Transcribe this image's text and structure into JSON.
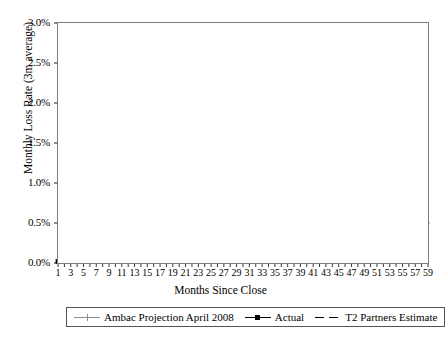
{
  "chart_data": {
    "type": "line",
    "title": "",
    "xlabel": "Months Since Close",
    "ylabel": "Monthly Loss Rate (3m average)",
    "xlim": [
      1,
      59
    ],
    "ylim": [
      0,
      3.0
    ],
    "y_tick_labels": [
      "0.0%",
      "0.5%",
      "1.0%",
      "1.5%",
      "2.0%",
      "2.5%",
      "3.0%"
    ],
    "y_tick_values": [
      0,
      0.5,
      1.0,
      1.5,
      2.0,
      2.5,
      3.0
    ],
    "x_tick_labels": [
      "1",
      "3",
      "5",
      "7",
      "9",
      "11",
      "13",
      "15",
      "17",
      "19",
      "21",
      "23",
      "25",
      "27",
      "29",
      "31",
      "33",
      "35",
      "37",
      "39",
      "41",
      "43",
      "45",
      "47",
      "49",
      "51",
      "53",
      "55",
      "57",
      "59"
    ],
    "x_tick_values": [
      1,
      3,
      5,
      7,
      9,
      11,
      13,
      15,
      17,
      19,
      21,
      23,
      25,
      27,
      29,
      31,
      33,
      35,
      37,
      39,
      41,
      43,
      45,
      47,
      49,
      51,
      53,
      55,
      57,
      59
    ],
    "x_minor_interval": 1,
    "grid": "horizontal-dotted",
    "legend_position": "bottom",
    "series": [
      {
        "name": "Ambac Projection April 2008",
        "color": "#8a8a8a",
        "style": "solid",
        "marker": "cross",
        "x": [
          1,
          2,
          3,
          4,
          5,
          6,
          7,
          8,
          9,
          10,
          11,
          12,
          13,
          14,
          15,
          16,
          17,
          18,
          19,
          20,
          21,
          22,
          23,
          24,
          25,
          26,
          27,
          28,
          29,
          30,
          31,
          32,
          33,
          34,
          35,
          36,
          37,
          38,
          39,
          40,
          41,
          42,
          43,
          44,
          45,
          46,
          47,
          48,
          49,
          50,
          51,
          52,
          53,
          54,
          55,
          56,
          57,
          58,
          59
        ],
        "y": [
          0.02,
          0.03,
          0.04,
          0.05,
          0.07,
          0.22,
          0.52,
          0.95,
          1.45,
          1.93,
          2.3,
          2.48,
          2.6,
          2.52,
          2.35,
          2.22,
          2.1,
          2.0,
          1.91,
          1.83,
          1.75,
          1.68,
          1.61,
          1.55,
          1.49,
          1.44,
          1.39,
          1.34,
          1.29,
          1.25,
          1.21,
          1.18,
          1.15,
          1.13,
          1.11,
          1.08,
          1.02,
          0.93,
          0.84,
          0.78,
          0.74,
          0.72,
          0.7,
          0.69,
          0.67,
          0.66,
          0.64,
          0.63,
          0.62,
          0.6,
          0.59,
          0.58,
          0.56,
          0.55,
          0.54,
          0.53,
          0.52,
          0.51,
          0.5
        ]
      },
      {
        "name": "Actual",
        "color": "#000000",
        "style": "solid",
        "marker": "square",
        "x": [
          1,
          2,
          3,
          4,
          5,
          6,
          7,
          8,
          9,
          10,
          11,
          12,
          13,
          14,
          15,
          16,
          17,
          18,
          19,
          20,
          21
        ],
        "y": [
          0.02,
          0.03,
          0.04,
          0.05,
          0.07,
          0.22,
          0.52,
          0.95,
          1.45,
          1.93,
          2.3,
          2.37,
          2.35,
          2.4,
          2.43,
          2.56,
          2.51,
          2.5,
          2.47,
          2.52,
          2.58
        ]
      },
      {
        "name": "T2 Partners Estimate",
        "color": "#000000",
        "style": "dashed",
        "marker": "none",
        "x": [
          21,
          22,
          23,
          24,
          25,
          26,
          27,
          28,
          29,
          30,
          31,
          32,
          33,
          34,
          35,
          36,
          37,
          38,
          39,
          40,
          41,
          42,
          43,
          44,
          45,
          46,
          47,
          48,
          49,
          50,
          51,
          52,
          53,
          54,
          55,
          56,
          57,
          58,
          59
        ],
        "y": [
          2.58,
          2.52,
          2.56,
          2.52,
          2.5,
          2.55,
          2.51,
          2.49,
          2.54,
          2.5,
          2.53,
          2.49,
          2.52,
          2.56,
          2.51,
          2.49,
          2.53,
          2.5,
          2.55,
          2.51,
          2.48,
          2.52,
          2.57,
          2.52,
          2.49,
          2.54,
          2.5,
          2.56,
          2.52,
          2.49,
          2.53,
          2.57,
          2.52,
          2.5,
          2.54,
          2.51,
          2.55,
          2.52,
          2.5
        ]
      }
    ]
  },
  "legend": {
    "items": [
      {
        "label": "Ambac Projection April 2008"
      },
      {
        "label": "Actual"
      },
      {
        "label": "T2 Partners Estimate"
      }
    ]
  }
}
